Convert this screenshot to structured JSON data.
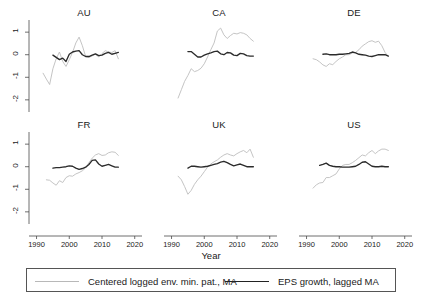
{
  "chart_data": {
    "type": "line",
    "title": "",
    "xlabel": "Year",
    "ylabel": "",
    "xlim": [
      1988,
      2021
    ],
    "ylim": [
      -2.45,
      1.45
    ],
    "xticks": [
      1990,
      2000,
      2010,
      2020
    ],
    "yticks": [
      1,
      0,
      -1,
      -2
    ],
    "xtick_labels": [
      "1990",
      "2000",
      "2010",
      "2020"
    ],
    "ytick_labels": [
      "1",
      "0",
      "-1",
      "-2"
    ],
    "grid": false,
    "legend_position": "bottom",
    "legend": [
      {
        "name": "Centered logged env. min. pat., MA",
        "color": "#bdbdbd",
        "style": "thin-light"
      },
      {
        "name": "EPS growth, lagged MA",
        "color": "#2b2b2b",
        "style": "thick-dark"
      }
    ],
    "layout": {
      "rows": 2,
      "cols": 3,
      "shared_y": true,
      "shared_x": true
    },
    "panels": [
      {
        "title": "AU",
        "row": 0,
        "col": 0,
        "series": [
          {
            "name": "Centered logged env. min. pat., MA",
            "x": [
              1992,
              1993,
              1994,
              1995,
              1996,
              1997,
              1998,
              1999,
              2000,
              2001,
              2002,
              2003,
              2004,
              2005,
              2006,
              2007,
              2008,
              2009,
              2010,
              2011,
              2012,
              2013,
              2014,
              2015
            ],
            "y": [
              -0.82,
              -1.08,
              -1.32,
              -0.62,
              -0.18,
              0.12,
              -0.3,
              -0.52,
              -0.22,
              0.1,
              0.52,
              0.78,
              0.4,
              -0.08,
              -0.12,
              -0.05,
              0.02,
              -0.1,
              0.05,
              0.18,
              0.12,
              0.1,
              0.18,
              -0.18
            ]
          },
          {
            "name": "EPS growth, lagged MA",
            "x": [
              1995,
              1996,
              1997,
              1998,
              1999,
              2000,
              2001,
              2002,
              2003,
              2004,
              2005,
              2006,
              2007,
              2008,
              2009,
              2010,
              2011,
              2012,
              2013,
              2014,
              2015
            ],
            "y": [
              -0.02,
              -0.12,
              -0.22,
              -0.15,
              -0.3,
              0.02,
              0.12,
              0.16,
              0.18,
              0.0,
              -0.08,
              -0.08,
              -0.02,
              0.04,
              -0.04,
              -0.02,
              0.06,
              0.1,
              0.02,
              0.06,
              0.1
            ]
          }
        ]
      },
      {
        "title": "CA",
        "row": 0,
        "col": 1,
        "series": [
          {
            "name": "Centered logged env. min. pat., MA",
            "x": [
              1992,
              1993,
              1994,
              1995,
              1996,
              1997,
              1998,
              1999,
              2000,
              2001,
              2002,
              2003,
              2004,
              2005,
              2006,
              2007,
              2008,
              2009,
              2010,
              2011,
              2012,
              2013,
              2014,
              2015
            ],
            "y": [
              -1.92,
              -1.55,
              -1.18,
              -0.92,
              -0.62,
              -0.75,
              -0.7,
              -0.6,
              -0.4,
              -0.1,
              0.22,
              0.52,
              1.05,
              1.18,
              0.88,
              0.72,
              0.85,
              0.95,
              0.92,
              0.98,
              0.95,
              0.88,
              0.72,
              0.6
            ]
          },
          {
            "name": "EPS growth, lagged MA",
            "x": [
              1995,
              1996,
              1997,
              1998,
              1999,
              2000,
              2001,
              2002,
              2003,
              2004,
              2005,
              2006,
              2007,
              2008,
              2009,
              2010,
              2011,
              2012,
              2013,
              2014,
              2015
            ],
            "y": [
              0.14,
              0.14,
              0.02,
              -0.1,
              -0.1,
              -0.02,
              0.04,
              0.08,
              0.14,
              0.16,
              0.04,
              0.0,
              0.1,
              0.08,
              -0.02,
              -0.04,
              0.06,
              0.04,
              -0.04,
              -0.06,
              -0.06
            ]
          }
        ]
      },
      {
        "title": "DE",
        "row": 0,
        "col": 2,
        "series": [
          {
            "name": "Centered logged env. min. pat., MA",
            "x": [
              1992,
              1993,
              1994,
              1995,
              1996,
              1997,
              1998,
              1999,
              2000,
              2001,
              2002,
              2003,
              2004,
              2005,
              2006,
              2007,
              2008,
              2009,
              2010,
              2011,
              2012,
              2013,
              2014,
              2015
            ],
            "y": [
              -0.18,
              -0.22,
              -0.32,
              -0.45,
              -0.52,
              -0.4,
              -0.44,
              -0.3,
              -0.18,
              -0.1,
              0.0,
              0.0,
              0.08,
              0.1,
              0.22,
              0.38,
              0.48,
              0.58,
              0.62,
              0.55,
              0.6,
              0.4,
              0.1,
              -0.08
            ]
          },
          {
            "name": "EPS growth, lagged MA",
            "x": [
              1995,
              1996,
              1997,
              1998,
              1999,
              2000,
              2001,
              2002,
              2003,
              2004,
              2005,
              2006,
              2007,
              2008,
              2009,
              2010,
              2011,
              2012,
              2013,
              2014,
              2015
            ],
            "y": [
              0.02,
              0.04,
              0.0,
              0.0,
              0.0,
              0.02,
              0.02,
              0.04,
              0.06,
              0.12,
              0.08,
              0.02,
              0.0,
              -0.02,
              -0.06,
              -0.08,
              -0.04,
              0.0,
              0.0,
              0.0,
              -0.06
            ]
          }
        ]
      },
      {
        "title": "FR",
        "row": 1,
        "col": 0,
        "series": [
          {
            "name": "Centered logged env. min. pat., MA",
            "x": [
              1993,
              1994,
              1995,
              1996,
              1997,
              1998,
              1999,
              2000,
              2001,
              2002,
              2003,
              2004,
              2005,
              2006,
              2007,
              2008,
              2009,
              2010,
              2011,
              2012,
              2013,
              2014,
              2015
            ],
            "y": [
              -0.58,
              -0.6,
              -0.72,
              -0.82,
              -0.62,
              -0.7,
              -0.48,
              -0.4,
              -0.42,
              -0.32,
              -0.26,
              -0.18,
              -0.05,
              0.18,
              0.38,
              0.52,
              0.58,
              0.5,
              0.52,
              0.62,
              0.66,
              0.64,
              0.5
            ]
          },
          {
            "name": "EPS growth, lagged MA",
            "x": [
              1995,
              1996,
              1997,
              1998,
              1999,
              2000,
              2001,
              2002,
              2003,
              2004,
              2005,
              2006,
              2007,
              2008,
              2009,
              2010,
              2011,
              2012,
              2013,
              2014,
              2015
            ],
            "y": [
              -0.06,
              -0.04,
              -0.04,
              -0.02,
              0.0,
              0.04,
              0.02,
              -0.06,
              -0.12,
              -0.08,
              -0.02,
              0.1,
              0.28,
              0.3,
              0.12,
              0.02,
              0.06,
              0.1,
              0.04,
              -0.02,
              -0.02
            ]
          }
        ]
      },
      {
        "title": "UK",
        "row": 1,
        "col": 1,
        "series": [
          {
            "name": "Centered logged env. min. pat., MA",
            "x": [
              1992,
              1993,
              1994,
              1995,
              1996,
              1997,
              1998,
              1999,
              2000,
              2001,
              2002,
              2003,
              2004,
              2005,
              2006,
              2007,
              2008,
              2009,
              2010,
              2011,
              2012,
              2013,
              2014,
              2015
            ],
            "y": [
              -0.42,
              -0.58,
              -0.88,
              -1.22,
              -1.05,
              -0.78,
              -0.58,
              -0.42,
              -0.22,
              -0.02,
              0.12,
              0.22,
              0.3,
              0.42,
              0.52,
              0.58,
              0.52,
              0.48,
              0.58,
              0.66,
              0.72,
              0.62,
              0.78,
              0.42
            ]
          },
          {
            "name": "EPS growth, lagged MA",
            "x": [
              1995,
              1996,
              1997,
              1998,
              1999,
              2000,
              2001,
              2002,
              2003,
              2004,
              2005,
              2006,
              2007,
              2008,
              2009,
              2010,
              2011,
              2012,
              2013,
              2014,
              2015
            ],
            "y": [
              -0.06,
              0.02,
              0.02,
              0.0,
              -0.02,
              0.0,
              0.02,
              0.06,
              0.1,
              0.14,
              0.2,
              0.24,
              0.18,
              0.1,
              0.04,
              0.08,
              0.12,
              0.06,
              0.0,
              0.0,
              0.0
            ]
          }
        ]
      },
      {
        "title": "US",
        "row": 1,
        "col": 2,
        "series": [
          {
            "name": "Centered logged env. min. pat., MA",
            "x": [
              1992,
              1993,
              1994,
              1995,
              1996,
              1997,
              1998,
              1999,
              2000,
              2001,
              2002,
              2003,
              2004,
              2005,
              2006,
              2007,
              2008,
              2009,
              2010,
              2011,
              2012,
              2013,
              2014,
              2015
            ],
            "y": [
              -0.95,
              -0.8,
              -0.72,
              -0.7,
              -0.48,
              -0.48,
              -0.4,
              -0.32,
              -0.1,
              0.06,
              0.1,
              0.1,
              0.18,
              0.28,
              0.4,
              0.52,
              0.48,
              0.62,
              0.72,
              0.58,
              0.7,
              0.78,
              0.78,
              0.72
            ]
          },
          {
            "name": "EPS growth, lagged MA",
            "x": [
              1994,
              1995,
              1996,
              1997,
              1998,
              1999,
              2000,
              2001,
              2002,
              2003,
              2004,
              2005,
              2006,
              2007,
              2008,
              2009,
              2010,
              2011,
              2012,
              2013,
              2014,
              2015
            ],
            "y": [
              0.06,
              0.1,
              0.16,
              0.06,
              0.02,
              0.0,
              0.0,
              -0.02,
              -0.02,
              -0.02,
              0.0,
              0.02,
              0.1,
              0.2,
              0.22,
              0.12,
              0.02,
              0.0,
              0.0,
              0.02,
              0.0,
              0.0
            ]
          }
        ]
      }
    ]
  }
}
